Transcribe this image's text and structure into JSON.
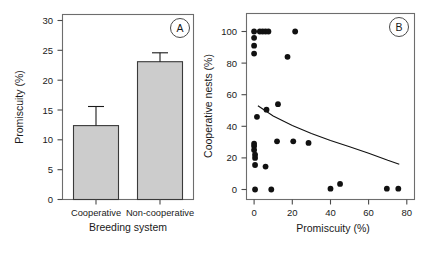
{
  "figure": {
    "background": "#ffffff",
    "bar_fill": "#cccccc",
    "line_color": "#111111",
    "point_color": "#111111"
  },
  "panelA": {
    "letter": "A",
    "chart_data": {
      "type": "bar",
      "title": "",
      "xlabel": "Breeding system",
      "ylabel": "Promiscuity (%)",
      "categories": [
        "Cooperative",
        "Non-cooperative"
      ],
      "values": [
        12.4,
        23.1
      ],
      "errors": [
        3.2,
        1.5
      ],
      "ylim": [
        0,
        31
      ],
      "yticks": [
        0,
        5,
        10,
        15,
        20,
        25,
        30
      ],
      "ytick_labels": [
        "0",
        "5",
        "10",
        "15",
        "20",
        "25",
        "30"
      ],
      "grid": false,
      "legend": "none"
    }
  },
  "panelB": {
    "letter": "B",
    "chart_data": {
      "type": "scatter",
      "title": "",
      "xlabel": "Promiscuity (%)",
      "ylabel": "Cooperative nests (%)",
      "xlim": [
        -4,
        84
      ],
      "ylim": [
        -6,
        107
      ],
      "xticks": [
        0,
        20,
        40,
        60,
        80
      ],
      "xtick_labels": [
        "0",
        "20",
        "40",
        "60",
        "80"
      ],
      "yticks": [
        0,
        20,
        40,
        60,
        80,
        100
      ],
      "ytick_labels": [
        "0",
        "20",
        "40",
        "60",
        "80",
        "100"
      ],
      "grid": false,
      "legend": "none",
      "points": [
        [
          0.0,
          100.0
        ],
        [
          3.0,
          100.0
        ],
        [
          4.5,
          100.0
        ],
        [
          6.0,
          100.0
        ],
        [
          7.5,
          100.0
        ],
        [
          21.5,
          100.0
        ],
        [
          0.0,
          96.0
        ],
        [
          0.0,
          91.0
        ],
        [
          0.0,
          86.0
        ],
        [
          17.5,
          84.0
        ],
        [
          12.5,
          54.0
        ],
        [
          6.5,
          50.5
        ],
        [
          1.5,
          46.0
        ],
        [
          0.0,
          29.0
        ],
        [
          0.0,
          27.5
        ],
        [
          0.0,
          25.0
        ],
        [
          0.5,
          22.0
        ],
        [
          0.5,
          20.0
        ],
        [
          0.5,
          15.5
        ],
        [
          6.0,
          14.5
        ],
        [
          12.0,
          30.5
        ],
        [
          20.5,
          30.5
        ],
        [
          28.5,
          29.5
        ],
        [
          0.5,
          0.0
        ],
        [
          9.0,
          0.0
        ],
        [
          40.0,
          0.5
        ],
        [
          45.0,
          3.5
        ],
        [
          69.5,
          0.5
        ],
        [
          75.5,
          0.5
        ]
      ],
      "fit_curve": {
        "description": "fitted declining curve",
        "x": [
          2,
          10,
          20,
          30,
          40,
          50,
          60,
          70,
          76
        ],
        "y": [
          53,
          46.5,
          40.5,
          35.5,
          31,
          27,
          23,
          18.5,
          16
        ]
      }
    }
  }
}
